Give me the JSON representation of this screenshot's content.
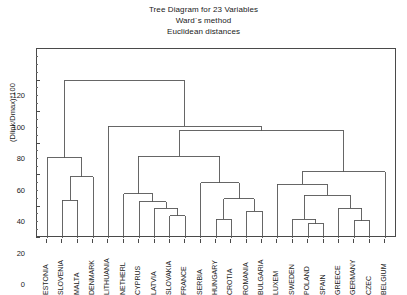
{
  "title": {
    "line1": "Tree Diagram for 23  Variables",
    "line2": "Ward`s method",
    "line3": "Euclidean distances"
  },
  "axis": {
    "y_label": "(Dlink/Dmax)*100",
    "y_ticks": [
      "0",
      "20",
      "40",
      "60",
      "80",
      "100",
      "120"
    ],
    "y_min": 0,
    "y_max": 120
  },
  "chart_data": {
    "type": "dendrogram",
    "title": "Tree Diagram for 23  Variables",
    "subtitle": "Ward`s method / Euclidean distances",
    "xlabel": "",
    "ylabel": "(Dlink/Dmax)*100",
    "ylim": [
      0,
      120
    ],
    "grid": false,
    "legend": "none",
    "method": "Ward`s method",
    "metric": "Euclidean distances",
    "n_variables": 23,
    "leaves": [
      "ESTONIA",
      "SLOVENIA",
      "MALTA",
      "DENMARK",
      "LITHUANIA",
      "NETHERL",
      "CYPRUS",
      "LATVIA",
      "SLOVAKIA",
      "FRANCE",
      "SERBIA",
      "HUNGARY",
      "CROTIA",
      "ROMANIA",
      "BULGARIA",
      "LUXEM",
      "SWEDEN",
      "POLAND",
      "SPAIN",
      "GREECE",
      "GERMANY",
      "CZEC",
      "BELGIUM"
    ],
    "merges": [
      {
        "id": "m1",
        "left": "SLOVENIA",
        "right": "MALTA",
        "height": 24
      },
      {
        "id": "m2",
        "left": "m1",
        "right": "DENMARK",
        "height": 39
      },
      {
        "id": "m3",
        "left": "ESTONIA",
        "right": "m2",
        "height": 51
      },
      {
        "id": "m4",
        "left": "SLOVAKIA",
        "right": "FRANCE",
        "height": 14
      },
      {
        "id": "m5",
        "left": "LATVIA",
        "right": "m4",
        "height": 19
      },
      {
        "id": "m6",
        "left": "CYPRUS",
        "right": "m5",
        "height": 23
      },
      {
        "id": "m7",
        "left": "NETHERL",
        "right": "m6",
        "height": 28
      },
      {
        "id": "m8",
        "left": "HUNGARY",
        "right": "CROTIA",
        "height": 12
      },
      {
        "id": "m9",
        "left": "ROMANIA",
        "right": "BULGARIA",
        "height": 17
      },
      {
        "id": "m10",
        "left": "m8",
        "right": "m9",
        "height": 25
      },
      {
        "id": "m11",
        "left": "SERBIA",
        "right": "m10",
        "height": 35
      },
      {
        "id": "m12",
        "left": "m7",
        "right": "m11",
        "height": 52
      },
      {
        "id": "m13",
        "left": "POLAND",
        "right": "SPAIN",
        "height": 9
      },
      {
        "id": "m14",
        "left": "SWEDEN",
        "right": "m13",
        "height": 12
      },
      {
        "id": "m15",
        "left": "GERMANY",
        "right": "CZEC",
        "height": 11
      },
      {
        "id": "m16",
        "left": "GREECE",
        "right": "m15",
        "height": 19
      },
      {
        "id": "m17",
        "left": "m14",
        "right": "m16",
        "height": 27
      },
      {
        "id": "m18",
        "left": "LUXEM",
        "right": "m17",
        "height": 34
      },
      {
        "id": "m19",
        "left": "m18",
        "right": "BELGIUM",
        "height": 42
      },
      {
        "id": "m20",
        "left": "m12",
        "right": "m19",
        "height": 68
      },
      {
        "id": "m21",
        "left": "LITHUANIA",
        "right": "m20",
        "height": 71
      },
      {
        "id": "m22",
        "left": "m3",
        "right": "m21",
        "height": 100
      }
    ]
  },
  "colors": {
    "line": "#555555",
    "axis": "#4a4a4a",
    "text": "#1a1a1a",
    "background": "#ffffff"
  }
}
